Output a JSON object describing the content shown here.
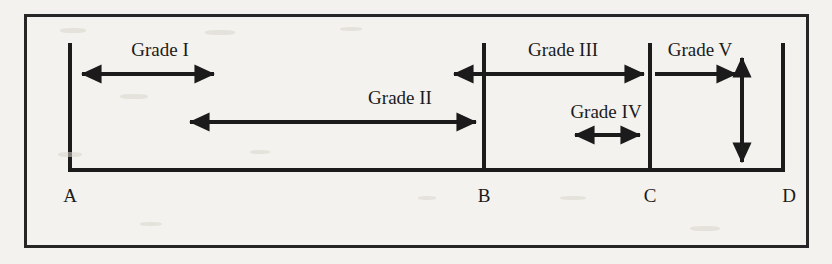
{
  "figure": {
    "name": "grade-classification-diagram",
    "background_color": "#f4f2ee",
    "ink_color": "#1b1b1b",
    "border": {
      "x": 25,
      "y": 15,
      "width": 783,
      "height": 232
    }
  },
  "baseline": {
    "y": 170,
    "x_start": 70,
    "x_end": 783
  },
  "points": [
    {
      "id": "A",
      "label": "A",
      "x": 70,
      "label_x": 70,
      "label_y": 186,
      "line_top": 45,
      "line_bottom": 170
    },
    {
      "id": "B",
      "label": "B",
      "x": 484,
      "label_x": 484,
      "label_y": 186,
      "line_top": 45,
      "line_bottom": 170
    },
    {
      "id": "C",
      "label": "C",
      "x": 650,
      "label_x": 650,
      "label_y": 186,
      "line_top": 45,
      "line_bottom": 170
    },
    {
      "id": "D",
      "label": "D",
      "x": 783,
      "label_x": 789,
      "label_y": 186,
      "line_top": 45,
      "line_bottom": 170
    }
  ],
  "grades": [
    {
      "id": "grade-1",
      "label": "Grade I",
      "arrow": {
        "orientation": "horizontal",
        "heads": "both",
        "x1": 74,
        "x2": 222,
        "y": 74
      },
      "label_x": 160,
      "label_y": 49
    },
    {
      "id": "grade-2",
      "label": "Grade II",
      "arrow": {
        "orientation": "horizontal",
        "heads": "both",
        "x1": 180,
        "x2": 484,
        "y": 122
      },
      "label_x": 400,
      "label_y": 96
    },
    {
      "id": "grade-3",
      "label": "Grade III",
      "arrow": {
        "orientation": "horizontal",
        "heads": "both",
        "x1": 444,
        "x2": 652,
        "y": 74
      },
      "label_x": 563,
      "label_y": 49
    },
    {
      "id": "grade-4",
      "label": "Grade IV",
      "arrow": {
        "orientation": "horizontal",
        "heads": "both",
        "x1": 565,
        "x2": 648,
        "y": 135
      },
      "label_x": 606,
      "label_y": 110
    },
    {
      "id": "grade-5",
      "label": "Grade V",
      "arrow": {
        "orientation": "horizontal",
        "heads": "right",
        "x1": 655,
        "x2": 744,
        "y": 74
      },
      "vertical_arrow": {
        "orientation": "vertical",
        "heads": "both",
        "x": 742,
        "y1": 48,
        "y2": 172
      },
      "label_x": 698,
      "label_y": 49
    }
  ]
}
